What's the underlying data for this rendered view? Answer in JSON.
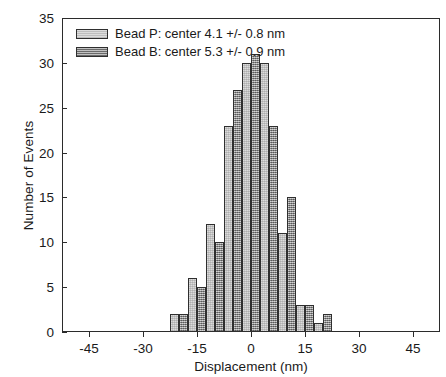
{
  "chart_data": {
    "type": "bar",
    "title": "",
    "subtitle": "",
    "xlabel": "Displacement (nm)",
    "ylabel": "Number of Events",
    "xlim": [
      -52.5,
      52.5
    ],
    "ylim": [
      0,
      35
    ],
    "xticks": [
      -45,
      -30,
      -15,
      0,
      15,
      30,
      45
    ],
    "yticks": [
      0,
      5,
      10,
      15,
      20,
      25,
      30,
      35
    ],
    "xtick_labels": [
      "-45",
      "-30",
      "-15",
      "0",
      "15",
      "30",
      "45"
    ],
    "ytick_labels": [
      "0",
      "5",
      "10",
      "15",
      "20",
      "25",
      "30",
      "35"
    ],
    "grid": false,
    "legend_position": "top-left",
    "bin_width": 5,
    "categories": [
      -25,
      -20,
      -15,
      -10,
      -5,
      0,
      5,
      10,
      15,
      20,
      25,
      30
    ],
    "series": [
      {
        "name": "Bead P: center 4.1 +/- 0.8 nm",
        "short_name": "Bead P",
        "center": 4.1,
        "center_error": 0.8,
        "units": "nm",
        "fill": "light-hatch",
        "color": "#dcdcdc",
        "values": [
          0,
          2,
          6,
          12,
          23,
          30,
          30,
          11,
          3,
          1,
          0,
          0
        ]
      },
      {
        "name": "Bead B: center 5.3 +/- 0.9 nm",
        "short_name": "Bead B",
        "center": 5.3,
        "center_error": 0.9,
        "units": "nm",
        "fill": "dark-hatch",
        "color": "#8e8e8e",
        "values": [
          0,
          2,
          5,
          10,
          27,
          31,
          23,
          15,
          3,
          2,
          0,
          0
        ]
      }
    ]
  },
  "legend": {
    "items": [
      {
        "label": "Bead P: center 4.1 +/- 0.8 nm"
      },
      {
        "label": "Bead B: center 5.3 +/- 0.9 nm"
      }
    ]
  },
  "axes": {
    "x_title": "Displacement (nm)",
    "y_title": "Number of Events"
  },
  "colors": {
    "series_p": "#dcdcdc",
    "series_b": "#8e8e8e",
    "axis": "#2b2b2b",
    "background": "#ffffff"
  }
}
